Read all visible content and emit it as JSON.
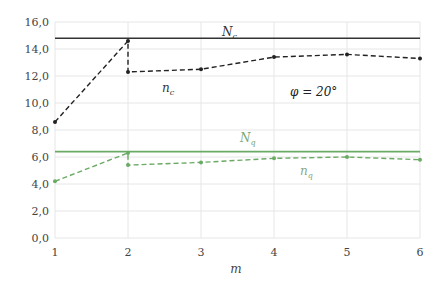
{
  "chart_data": {
    "type": "line",
    "title": "",
    "xlabel": "m",
    "ylabel": "",
    "x": [
      1,
      2,
      3,
      4,
      5,
      6
    ],
    "xlim": [
      1,
      6
    ],
    "ylim": [
      0,
      16
    ],
    "yticks": [
      "0,0",
      "2,0",
      "4,0",
      "6,0",
      "8,0",
      "10,0",
      "12,0",
      "14,0",
      "16,0"
    ],
    "xticks": [
      "1",
      "2",
      "3",
      "4",
      "5",
      "6"
    ],
    "grid": true,
    "annotation": "φ = 20°",
    "series": [
      {
        "name": "N_c",
        "label": "N",
        "sub": "c",
        "style": "solid",
        "color": "#333333",
        "points": [
          [
            1,
            14.8
          ],
          [
            6,
            14.8
          ]
        ]
      },
      {
        "name": "n_c",
        "label": "n",
        "sub": "c",
        "style": "dashed",
        "color": "#222222",
        "points": [
          [
            1,
            8.6
          ],
          [
            2,
            14.6
          ],
          [
            2,
            12.3
          ],
          [
            3,
            12.5
          ],
          [
            4,
            13.4
          ],
          [
            5,
            13.6
          ],
          [
            6,
            13.3
          ]
        ]
      },
      {
        "name": "N_q",
        "label": "N",
        "sub": "q",
        "style": "solid",
        "color": "#6aaa64",
        "points": [
          [
            1,
            6.4
          ],
          [
            6,
            6.4
          ]
        ]
      },
      {
        "name": "n_q",
        "label": "n",
        "sub": "q",
        "style": "dashed",
        "color": "#6aaa64",
        "points": [
          [
            1,
            4.2
          ],
          [
            2,
            6.3
          ],
          [
            2,
            5.4
          ],
          [
            3,
            5.6
          ],
          [
            4,
            5.9
          ],
          [
            5,
            6.0
          ],
          [
            6,
            5.8
          ]
        ]
      }
    ]
  }
}
